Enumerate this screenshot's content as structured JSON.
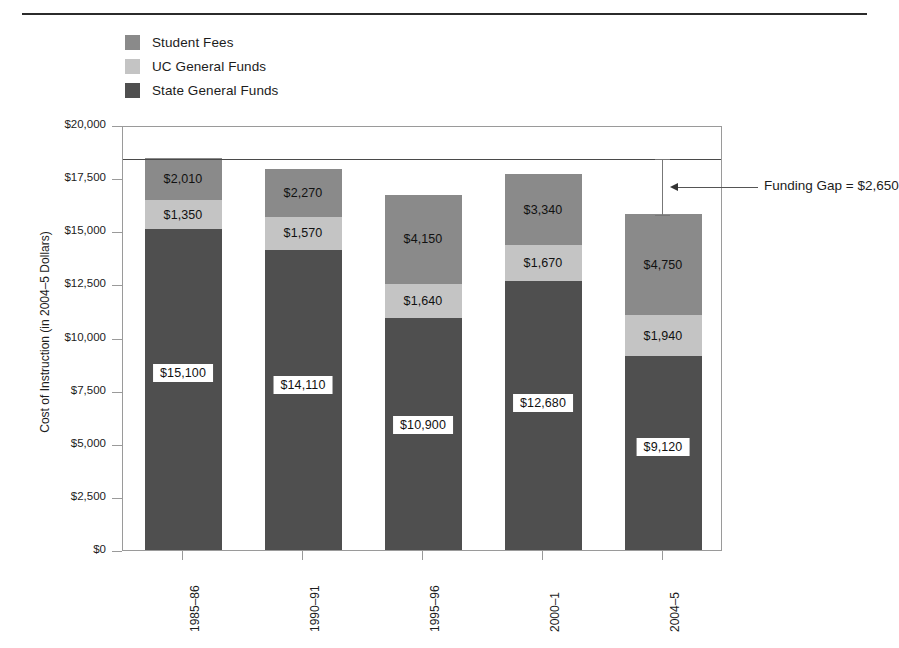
{
  "figure": {
    "has_top_rule": true,
    "background": "#ffffff"
  },
  "chart_data": {
    "type": "bar",
    "subtype": "stacked-bar",
    "title": "",
    "xlabel": "",
    "ylabel": "Cost of Instruction (in 2004–5 Dollars)",
    "ylim": [
      0,
      20000
    ],
    "ytick_values": [
      0,
      2500,
      5000,
      7500,
      10000,
      12500,
      15000,
      17500,
      20000
    ],
    "ytick_labels": [
      "$0",
      "$2,500",
      "$5,000",
      "$7,500",
      "$10,000",
      "$12,500",
      "$15,000",
      "$17,500",
      "$20,000"
    ],
    "grid": false,
    "legend_position": "above-plot-left",
    "categories": [
      "1985–86",
      "1990–91",
      "1995–96",
      "2000–1",
      "2004–5"
    ],
    "series": [
      {
        "name": "State General Funds",
        "color": "#4f4f4f",
        "values": [
          15100,
          14110,
          10900,
          12680,
          9120
        ],
        "labels": [
          "$15,100",
          "$14,110",
          "$10,900",
          "$12,680",
          "$9,120"
        ],
        "label_style": "boxed"
      },
      {
        "name": "UC General Funds",
        "color": "#c4c4c4",
        "values": [
          1350,
          1570,
          1640,
          1670,
          1940
        ],
        "labels": [
          "$1,350",
          "$1,570",
          "$1,640",
          "$1,670",
          "$1,940"
        ],
        "label_style": "plain"
      },
      {
        "name": "Student Fees",
        "color": "#8a8a8a",
        "values": [
          2010,
          2270,
          4150,
          3340,
          4750
        ],
        "labels": [
          "$2,010",
          "$2,270",
          "$4,150",
          "$3,340",
          "$4,750"
        ],
        "label_style": "plain"
      }
    ],
    "stack_order_bottom_to_top": [
      "State General Funds",
      "UC General Funds",
      "Student Fees"
    ],
    "totals": [
      18460,
      17950,
      16690,
      17690,
      15810
    ],
    "reference_line": {
      "value": 18460,
      "color": "#4a4a4a"
    },
    "annotations": [
      {
        "name": "funding-gap",
        "text": "Funding Gap = $2,650",
        "value": 2650,
        "from": 15810,
        "to": 18460,
        "category": "2004–5"
      }
    ]
  },
  "legend": {
    "items": [
      {
        "label": "Student Fees",
        "color": "#8a8a8a"
      },
      {
        "label": "UC General Funds",
        "color": "#c4c4c4"
      },
      {
        "label": "State General Funds",
        "color": "#4f4f4f"
      }
    ]
  }
}
